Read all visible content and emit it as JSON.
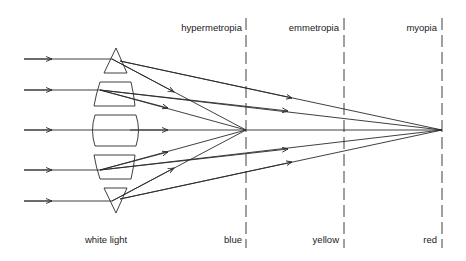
{
  "diagram": {
    "title_labels": {
      "hypermetropia": "hypermetropia",
      "emmetropia": "emmetropia",
      "myopia": "myopia"
    },
    "bottom_labels": {
      "white_light": "white light",
      "blue": "blue",
      "yellow": "yellow",
      "red": "red"
    },
    "colors": {
      "line": "#2a2a2a",
      "background": "#ffffff"
    },
    "incoming_rays_y": [
      59,
      90,
      130,
      169,
      201
    ],
    "lens_elements": [
      "top-prism",
      "upper-trapezoid",
      "center-block",
      "lower-trapezoid",
      "bottom-prism"
    ],
    "focal_planes": [
      {
        "name": "blue",
        "condition": "hypermetropia",
        "x": 246
      },
      {
        "name": "yellow",
        "condition": "emmetropia",
        "x": 344
      },
      {
        "name": "red",
        "condition": "myopia",
        "x": 442
      }
    ]
  }
}
